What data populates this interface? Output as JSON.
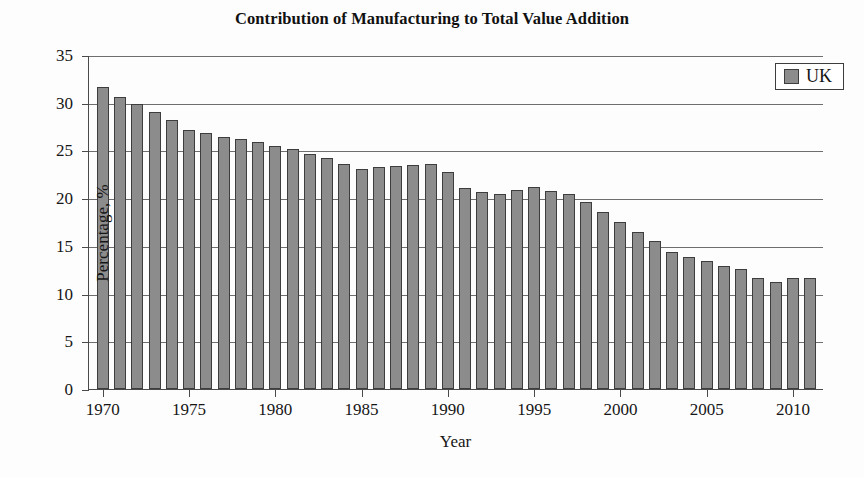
{
  "chart_data": {
    "type": "bar",
    "title": "Contribution of Manufacturing to Total Value Addition",
    "xlabel": "Year",
    "ylabel": "Percentage, %",
    "ylim": [
      0,
      35
    ],
    "ytick_step": 5,
    "yticks": [
      0,
      5,
      10,
      15,
      20,
      25,
      30,
      35
    ],
    "xlim": [
      1969.2,
      2011.8
    ],
    "xticks": [
      1970,
      1975,
      1980,
      1985,
      1990,
      1995,
      2000,
      2005,
      2010
    ],
    "grid": "horizontal",
    "legend": {
      "position": "top-right",
      "entries": [
        {
          "name": "UK",
          "color": "#8c8c8c"
        }
      ]
    },
    "series": [
      {
        "name": "UK",
        "color": "#8c8c8c",
        "edge_color": "#3d3d3d",
        "categories": [
          1970,
          1971,
          1972,
          1973,
          1974,
          1975,
          1976,
          1977,
          1978,
          1979,
          1980,
          1981,
          1982,
          1983,
          1984,
          1985,
          1986,
          1987,
          1988,
          1989,
          1990,
          1991,
          1992,
          1993,
          1994,
          1995,
          1996,
          1997,
          1998,
          1999,
          2000,
          2001,
          2002,
          2003,
          2004,
          2005,
          2006,
          2007,
          2008,
          2009,
          2010,
          2011
        ],
        "values": [
          31.7,
          30.6,
          29.9,
          29.0,
          28.2,
          27.1,
          26.8,
          26.4,
          26.2,
          25.9,
          25.5,
          25.1,
          24.6,
          24.2,
          23.6,
          23.1,
          23.3,
          23.4,
          23.5,
          23.6,
          22.7,
          21.1,
          20.6,
          20.4,
          20.9,
          21.2,
          20.7,
          20.4,
          19.6,
          18.5,
          17.5,
          16.5,
          15.5,
          14.4,
          13.8,
          13.4,
          12.9,
          12.6,
          11.6,
          11.2,
          11.6,
          11.6
        ]
      }
    ]
  },
  "axes": {
    "y_tick_labels": [
      "0",
      "5",
      "10",
      "15",
      "20",
      "25",
      "30",
      "35"
    ],
    "x_tick_labels": [
      "1970",
      "1975",
      "1980",
      "1985",
      "1990",
      "1995",
      "2000",
      "2005",
      "2010"
    ]
  }
}
